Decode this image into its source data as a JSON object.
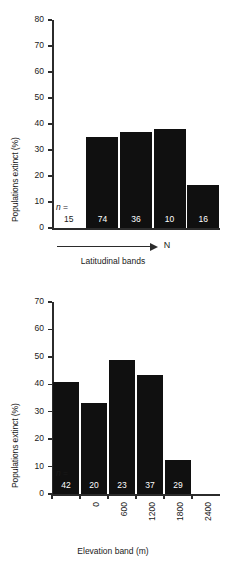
{
  "figure": {
    "background": "#ffffff",
    "bar_color": "#101010",
    "axis_color": "#2b2b2b"
  },
  "chart_data": [
    {
      "id": "latitudinal",
      "type": "bar",
      "title": "",
      "xlabel": "Latitudinal bands",
      "ylabel": "Populations extinct (%)",
      "ylim": [
        0,
        80
      ],
      "yticks": [
        0,
        10,
        20,
        30,
        40,
        50,
        60,
        70,
        80
      ],
      "ytick_labels": [
        "0",
        "10",
        "20",
        "30",
        "40",
        "50",
        "60",
        "70",
        "80"
      ],
      "grid": false,
      "legend": "none",
      "categories": [
        "1",
        "2",
        "3",
        "4",
        "5"
      ],
      "values": [
        0,
        35.0,
        37.0,
        38.0,
        16.5
      ],
      "sample_sizes": [
        15,
        74,
        36,
        10,
        16
      ],
      "sample_label": "n =",
      "annotations": {
        "direction_arrow": "→",
        "direction_label": "N"
      }
    },
    {
      "id": "elevation",
      "type": "bar",
      "title": "",
      "xlabel": "Elevation band (m)",
      "ylabel": "Populations extinct (%)",
      "ylim": [
        0,
        70
      ],
      "yticks": [
        0,
        10,
        20,
        30,
        40,
        50,
        60,
        70
      ],
      "ytick_labels": [
        "0",
        "10",
        "20",
        "30",
        "40",
        "50",
        "60",
        "70"
      ],
      "grid": false,
      "legend": "none",
      "categories": [
        "0",
        "600",
        "1200",
        "1800",
        "2400",
        "3450"
      ],
      "xtick_labels": [
        "0",
        "600",
        "1200",
        "1800",
        "2400",
        "3450"
      ],
      "values": [
        41.0,
        33.0,
        49.0,
        43.5,
        12.3
      ],
      "sample_sizes": [
        42,
        20,
        23,
        37,
        29
      ],
      "sample_label": "n ="
    }
  ]
}
